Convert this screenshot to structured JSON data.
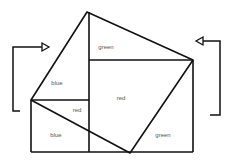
{
  "diagram": {
    "type": "geometric-proof",
    "stroke_color": "#111111",
    "label_color": "#555555",
    "tilted_square": [
      [
        87,
        12
      ],
      [
        193,
        60
      ],
      [
        130,
        153
      ],
      [
        31,
        100
      ]
    ],
    "lines": [
      {
        "name": "center-vertical",
        "x1": 89,
        "y1": 12,
        "x2": 89,
        "y2": 152
      },
      {
        "name": "upper-horizontal",
        "x1": 89,
        "y1": 60,
        "x2": 193,
        "y2": 60
      },
      {
        "name": "left-horizontal",
        "x1": 31,
        "y1": 100,
        "x2": 89,
        "y2": 100
      },
      {
        "name": "left-vertical",
        "x1": 31,
        "y1": 100,
        "x2": 31,
        "y2": 152
      },
      {
        "name": "bottom-horizontal",
        "x1": 31,
        "y1": 152,
        "x2": 193,
        "y2": 152
      },
      {
        "name": "right-vertical",
        "x1": 193,
        "y1": 60,
        "x2": 193,
        "y2": 152
      }
    ],
    "arrows": {
      "left": {
        "points": [
          [
            20,
            111
          ],
          [
            13,
            111
          ],
          [
            13,
            47
          ],
          [
            42,
            47
          ]
        ],
        "head": [
          [
            42,
            43
          ],
          [
            49,
            47
          ],
          [
            42,
            51
          ]
        ],
        "direction": "right"
      },
      "right": {
        "points": [
          [
            210,
            115
          ],
          [
            220,
            115
          ],
          [
            220,
            41
          ],
          [
            203,
            41
          ]
        ],
        "head": [
          [
            203,
            37
          ],
          [
            196,
            41
          ],
          [
            203,
            45
          ]
        ],
        "direction": "left"
      }
    },
    "labels": [
      {
        "text": "green",
        "x": 106,
        "y": 47
      },
      {
        "text": "blue",
        "x": 57,
        "y": 83
      },
      {
        "text": "red",
        "x": 121,
        "y": 98
      },
      {
        "text": "red",
        "x": 77,
        "y": 110
      },
      {
        "text": "blue",
        "x": 56,
        "y": 135
      },
      {
        "text": "green",
        "x": 163,
        "y": 135
      }
    ]
  }
}
